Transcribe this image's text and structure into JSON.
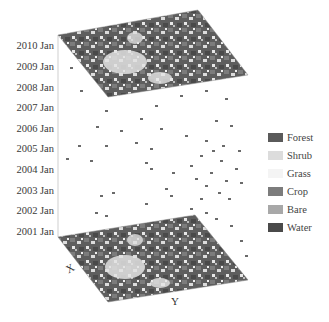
{
  "figure": {
    "time_axis": {
      "labels": [
        "2010 Jan",
        "2009 Jan",
        "2008 Jan",
        "2007 Jan",
        "2006 Jan",
        "2005 Jan",
        "2004 Jan",
        "2003 Jan",
        "2002 Jan",
        "2001 Jan"
      ]
    },
    "axes": {
      "x_label": "X",
      "y_label": "Y"
    },
    "legend": [
      {
        "label": "Forest",
        "color": "#5a5a5a"
      },
      {
        "label": "Shrub",
        "color": "#dcdcdc"
      },
      {
        "label": "Grass",
        "color": "#f4f4f4"
      },
      {
        "label": "Crop",
        "color": "#7c7c7c"
      },
      {
        "label": "Bare",
        "color": "#a8a8a8"
      },
      {
        "label": "Water",
        "color": "#4a4a4a"
      }
    ],
    "planes": [
      {
        "name": "top-plane-2010",
        "label": "2010 Jan"
      },
      {
        "name": "bottom-plane-2001",
        "label": "2001 Jan"
      }
    ]
  }
}
